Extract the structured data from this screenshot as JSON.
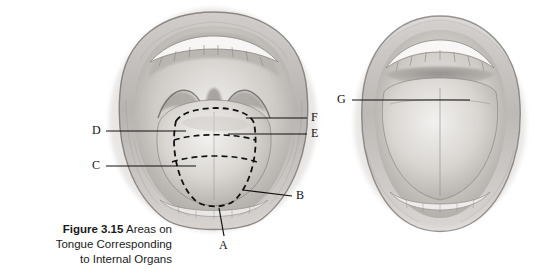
{
  "figure": {
    "number": "Figure 3.15",
    "caption_line1": "Areas on",
    "caption_line2": "Tongue Corresponding",
    "caption_line3": "to Internal Organs",
    "caption_full": "Figure 3.15 Areas on Tongue Corresponding to Internal Organs"
  },
  "labels": [
    {
      "id": "A",
      "text": "A"
    },
    {
      "id": "B",
      "text": "B"
    },
    {
      "id": "C",
      "text": "C"
    },
    {
      "id": "D",
      "text": "D"
    },
    {
      "id": "E",
      "text": "E"
    },
    {
      "id": "F",
      "text": "F"
    },
    {
      "id": "G",
      "text": "G"
    }
  ],
  "illustrations": [
    {
      "name": "open-mouth-with-tongue-zones",
      "description": "Pencil drawing of an open mouth showing teeth, palate and tongue with dashed zone outlines"
    },
    {
      "name": "open-mouth-wide",
      "description": "Pencil drawing of a wide open mouth showing teeth and tongue"
    }
  ],
  "colors": {
    "line": "#111111",
    "text": "#1a1a1a",
    "background": "#ffffff",
    "drawing_light": "#d8d5d2",
    "drawing_mid": "#a9a5a2",
    "drawing_dark": "#6f6b68"
  }
}
